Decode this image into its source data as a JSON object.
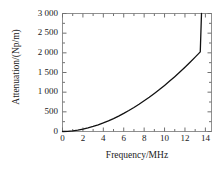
{
  "chart_data": {
    "type": "line",
    "title": "",
    "xlabel": "Frequency/MHz",
    "ylabel": "Attenuation/(Np/m)",
    "xlim": [
      0,
      14.6
    ],
    "ylim": [
      0,
      3000
    ],
    "xticks": [
      "0",
      "2",
      "4",
      "6",
      "8",
      "10",
      "12",
      "14"
    ],
    "xtick_values": [
      0,
      2,
      4,
      6,
      8,
      10,
      12,
      14
    ],
    "yticks": [
      "0",
      "500",
      "1 000",
      "1 500",
      "2 000",
      "2 500",
      "3 000"
    ],
    "ytick_values": [
      0,
      500,
      1000,
      1500,
      2000,
      2500,
      3000
    ],
    "grid": false,
    "legend": null,
    "minor_ticks": true,
    "line_color": "#000000",
    "frame_color": "#808080",
    "series": [
      {
        "name": "attenuation",
        "x": [
          0,
          0.5,
          1,
          1.5,
          2,
          2.5,
          3,
          3.5,
          4,
          4.5,
          5,
          5.5,
          6,
          6.5,
          7,
          7.5,
          8,
          8.5,
          9,
          9.5,
          10,
          10.5,
          11,
          11.5,
          12,
          12.5,
          13,
          13.5,
          13.62
        ],
        "y": [
          0,
          4,
          16,
          35,
          60,
          91,
          128,
          170,
          218,
          271,
          329,
          392,
          460,
          533,
          611,
          693,
          780,
          871,
          967,
          1067,
          1172,
          1281,
          1394,
          1512,
          1634,
          1760,
          1890,
          2024,
          3000
        ]
      }
    ]
  }
}
